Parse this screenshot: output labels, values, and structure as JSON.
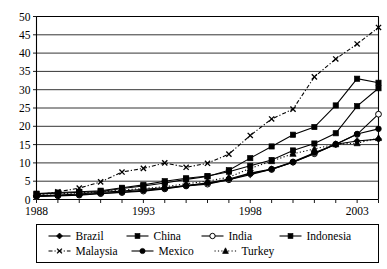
{
  "chart_data": {
    "type": "line",
    "title": "",
    "subtitle": "",
    "xlabel": "",
    "ylabel": "",
    "xlim": [
      1988,
      2004
    ],
    "ylim": [
      0,
      50
    ],
    "grid": true,
    "grid_axis": "y",
    "legend_position": "bottom",
    "x": [
      1988,
      1989,
      1990,
      1991,
      1992,
      1993,
      1994,
      1995,
      1996,
      1997,
      1998,
      1999,
      2000,
      2001,
      2002,
      2003,
      2004
    ],
    "xticklabels": [
      "1988",
      "",
      "",
      "",
      "",
      "1993",
      "",
      "",
      "",
      "",
      "1998",
      "",
      "",
      "",
      "",
      "2003",
      ""
    ],
    "xtick_major": [
      "1988",
      "1993",
      "1998",
      "2003"
    ],
    "yticklabels": [
      "0",
      "5",
      "10",
      "15",
      "20",
      "25",
      "30",
      "35",
      "40",
      "45",
      "50"
    ],
    "yticks": [
      0,
      5,
      10,
      15,
      20,
      25,
      30,
      35,
      40,
      45,
      50
    ],
    "series": [
      {
        "name": "Brazil",
        "marker": "diamond",
        "linestyle": "solid",
        "color": "#000000",
        "values": [
          1.0,
          1.2,
          1.5,
          2.0,
          2.3,
          2.8,
          3.2,
          3.8,
          4.4,
          5.4,
          6.8,
          8.3,
          10.2,
          12.6,
          15.1,
          16.0,
          16.5
        ]
      },
      {
        "name": "China",
        "marker": "square",
        "linestyle": "solid",
        "color": "#000000",
        "values": [
          1.6,
          1.9,
          2.1,
          2.4,
          3.2,
          4.0,
          5.0,
          5.8,
          6.4,
          7.6,
          9.2,
          10.8,
          13.4,
          15.3,
          18.1,
          25.5,
          30.4
        ]
      },
      {
        "name": "India",
        "marker": "circle-open",
        "linestyle": "solid",
        "color": "#000000",
        "values": [
          0.8,
          1.0,
          1.2,
          1.6,
          1.9,
          2.3,
          2.9,
          3.7,
          4.2,
          5.4,
          7.1,
          8.2,
          10.2,
          12.5,
          15.1,
          17.8,
          23.3
        ]
      },
      {
        "name": "Indonesia",
        "marker": "square",
        "linestyle": "solid",
        "color": "#000000",
        "values": [
          1.5,
          1.7,
          2.0,
          2.2,
          3.0,
          3.7,
          4.5,
          5.5,
          6.3,
          8.0,
          11.3,
          14.5,
          17.7,
          19.8,
          25.7,
          33.0,
          31.9
        ]
      },
      {
        "name": "Malaysia",
        "marker": "x",
        "linestyle": "dashdot",
        "color": "#000000",
        "values": [
          1.2,
          2.1,
          3.1,
          4.8,
          7.5,
          8.5,
          10.0,
          8.8,
          9.9,
          12.4,
          17.5,
          22.0,
          24.7,
          33.5,
          38.4,
          42.5,
          47.0
        ]
      },
      {
        "name": "Mexico",
        "marker": "circle-filled",
        "linestyle": "solid",
        "color": "#000000",
        "values": [
          0.9,
          1.1,
          1.3,
          1.7,
          2.0,
          2.5,
          3.0,
          3.8,
          4.5,
          5.6,
          7.2,
          8.3,
          10.3,
          12.8,
          15.1,
          17.9,
          19.3
        ]
      },
      {
        "name": "Turkey",
        "marker": "triangle",
        "linestyle": "dotted",
        "color": "#000000",
        "values": [
          1.4,
          1.6,
          1.8,
          2.1,
          2.6,
          3.0,
          3.5,
          4.3,
          5.0,
          6.1,
          8.5,
          10.5,
          12.5,
          13.8,
          15.1,
          15.4,
          16.8
        ]
      }
    ]
  },
  "legend": {
    "entries": [
      {
        "label": "Brazil"
      },
      {
        "label": "China"
      },
      {
        "label": "India"
      },
      {
        "label": "Indonesia"
      },
      {
        "label": "Malaysia"
      },
      {
        "label": "Mexico"
      },
      {
        "label": "Turkey"
      }
    ]
  }
}
